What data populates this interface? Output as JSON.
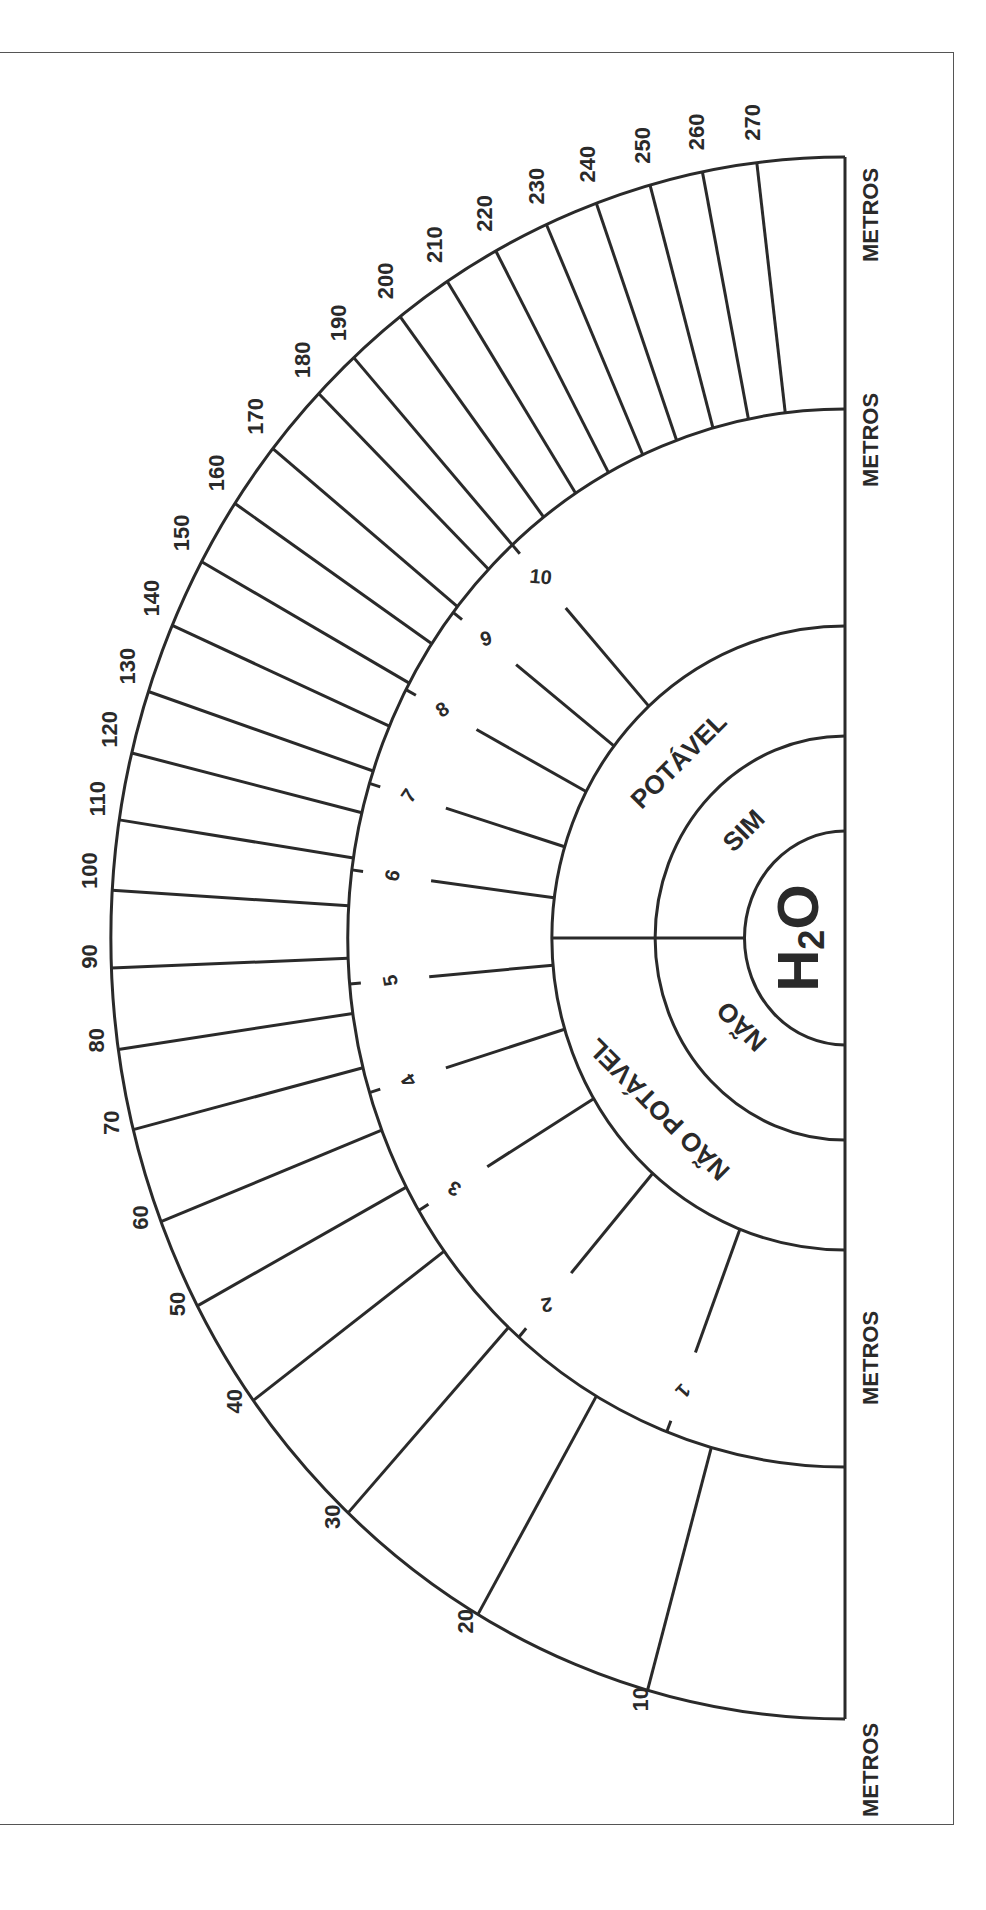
{
  "diagram": {
    "title": "H2O",
    "title_main": "H",
    "title_sub": "2",
    "title_end": "O",
    "center": {
      "x": 845,
      "y": 938
    },
    "scale_x": 0.94,
    "rings": [
      {
        "name": "h2o-ring",
        "r": 107
      },
      {
        "name": "sim-nao-ring",
        "r": 202
      },
      {
        "name": "potavel-ring",
        "r": 312
      },
      {
        "name": "number-ring",
        "r": 529
      },
      {
        "name": "distance-ring",
        "r": 781
      }
    ],
    "inner_labels": [
      {
        "text": "SIM",
        "x": 745,
        "y": 832,
        "rotate": -45,
        "size": 26
      },
      {
        "text": "NÃO",
        "x": 743,
        "y": 1025,
        "rotate": 225,
        "size": 26
      },
      {
        "text": "POTÁVEL",
        "x": 680,
        "y": 762,
        "rotate": -45,
        "size": 26
      },
      {
        "text": "NÃO POTÁVEL",
        "x": 660,
        "y": 1108,
        "rotate": 225,
        "size": 26
      }
    ],
    "scale_marks": [
      {
        "label": "1",
        "angle": 21
      },
      {
        "label": "2",
        "angle": 41
      },
      {
        "label": "3",
        "angle": 59
      },
      {
        "label": "4",
        "angle": 73
      },
      {
        "label": "5",
        "angle": 85
      },
      {
        "label": "6",
        "angle": 97.4
      },
      {
        "label": "7",
        "angle": 107
      },
      {
        "label": "8",
        "angle": 118
      },
      {
        "label": "9",
        "angle": 128
      },
      {
        "label": "10",
        "angle": 138
      }
    ],
    "distance_marks": [
      {
        "label": "10",
        "angle": 15.6
      },
      {
        "label": "20",
        "angle": 30
      },
      {
        "label": "30",
        "angle": 42.6
      },
      {
        "label": "40",
        "angle": 53.7
      },
      {
        "label": "50",
        "angle": 61.9
      },
      {
        "label": "60",
        "angle": 68.7
      },
      {
        "label": "70",
        "angle": 75.8
      },
      {
        "label": "80",
        "angle": 81.8
      },
      {
        "label": "90",
        "angle": 87.8
      },
      {
        "label": "100",
        "angle": 93.5
      },
      {
        "label": "110",
        "angle": 98.7
      },
      {
        "label": "120",
        "angle": 103.7
      },
      {
        "label": "130",
        "angle": 108.4
      },
      {
        "label": "140",
        "angle": 113.6
      },
      {
        "label": "150",
        "angle": 118.8
      },
      {
        "label": "160",
        "angle": 123.8
      },
      {
        "label": "170",
        "angle": 128.8
      },
      {
        "label": "180",
        "angle": 134.2
      },
      {
        "label": "190",
        "angle": 138
      },
      {
        "label": "200",
        "angle": 142.7
      },
      {
        "label": "210",
        "angle": 147.2
      },
      {
        "label": "220",
        "angle": 151.6
      },
      {
        "label": "230",
        "angle": 156
      },
      {
        "label": "240",
        "angle": 160.2
      },
      {
        "label": "250",
        "angle": 164.6
      },
      {
        "label": "260",
        "angle": 168.8
      },
      {
        "label": "270",
        "angle": 173.1
      }
    ],
    "unit_labels": [
      {
        "text": "METROS",
        "y": 1770
      },
      {
        "text": "METROS",
        "y": 1358
      },
      {
        "text": "METROS",
        "y": 440
      },
      {
        "text": "METROS",
        "y": 215
      }
    ]
  }
}
